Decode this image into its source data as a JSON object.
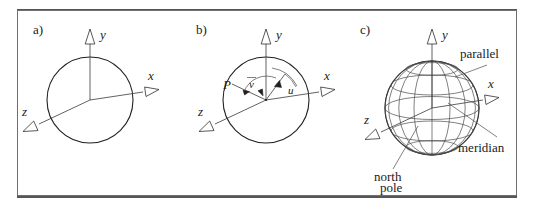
{
  "figure": {
    "background_color": "#ffffff",
    "line_color": "#231f20",
    "frame_color": "#6f6f72",
    "panel_count": 3
  },
  "panels": [
    {
      "id": "a",
      "label": "a)",
      "description": "circle with xyz axes",
      "axes": [
        {
          "name": "y",
          "label": "y",
          "direction": "up"
        },
        {
          "name": "x",
          "label": "x",
          "direction": "right"
        },
        {
          "name": "z",
          "label": "z",
          "direction": "lower-left"
        }
      ],
      "shape": "circle"
    },
    {
      "id": "b",
      "label": "b)",
      "description": "circle with point P and angles u and v",
      "axes": [
        {
          "name": "y",
          "label": "y",
          "direction": "up"
        },
        {
          "name": "x",
          "label": "x",
          "direction": "right"
        },
        {
          "name": "z",
          "label": "z",
          "direction": "lower-left"
        }
      ],
      "point_label": "P",
      "angles": [
        {
          "name": "v",
          "label": "v",
          "overbar": true
        },
        {
          "name": "u",
          "label": "u",
          "overbar": false
        }
      ],
      "shape": "circle"
    },
    {
      "id": "c",
      "label": "c)",
      "description": "wireframe sphere with meridians and parallels",
      "axes": [
        {
          "name": "y",
          "label": "y",
          "direction": "up"
        },
        {
          "name": "x",
          "label": "x",
          "direction": "right"
        },
        {
          "name": "z",
          "label": "z",
          "direction": "lower-left"
        }
      ],
      "annotations": [
        {
          "name": "parallel",
          "label": "parallel",
          "target": "horizontal-ring"
        },
        {
          "name": "meridian",
          "label": "meridian",
          "target": "vertical-ring"
        },
        {
          "name": "north-pole",
          "label_line1": "north",
          "label_line2": "pole",
          "target": "bottom-pole"
        }
      ],
      "shape": "sphere-wireframe",
      "meridian_count": 8,
      "parallel_count": 5
    }
  ]
}
